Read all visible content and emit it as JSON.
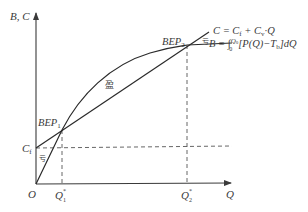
{
  "diagram": {
    "type": "break-even analysis",
    "axes": {
      "y_label": "B, C",
      "x_label": "Q",
      "origin_label": "O"
    },
    "y_ticks": {
      "fixed_cost": "C",
      "fixed_cost_sub": "f"
    },
    "x_ticks": {
      "q1": "Q",
      "q1_sup": "*",
      "q1_sub": "1",
      "q2": "Q",
      "q2_sup": "*",
      "q2_sub": "2"
    },
    "points": {
      "bep1": "BEP",
      "bep1_sub": "1",
      "bep2": "BEP",
      "bep2_sub": "2"
    },
    "regions": {
      "profit": "盈",
      "loss_left": "亏",
      "loss_right": "亏"
    },
    "equations": {
      "cost": "C = C",
      "cost_sub_f": "f",
      "cost_rest": " + C",
      "cost_sub_v": "v",
      "cost_tail": "·Q",
      "benefit_prefix": "B = ∫",
      "benefit_upper": "Q",
      "benefit_upper_sub": "0",
      "benefit_lower": "0",
      "benefit_body": "[P(Q)−T",
      "benefit_body_sub": "b",
      "benefit_tail": "]dQ"
    }
  }
}
